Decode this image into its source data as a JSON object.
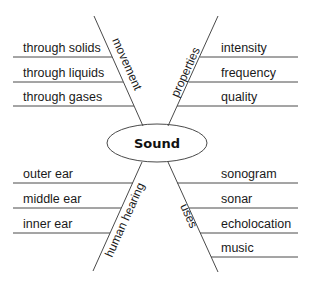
{
  "diagram": {
    "center": "Sound",
    "branches": {
      "movement": {
        "label": "movement",
        "items": [
          "through solids",
          "through liquids",
          "through gases"
        ]
      },
      "properties": {
        "label": "properties",
        "items": [
          "intensity",
          "frequency",
          "quality"
        ]
      },
      "human_hearing": {
        "label": "human hearing",
        "items": [
          "outer ear",
          "middle ear",
          "inner ear"
        ]
      },
      "uses": {
        "label": "uses",
        "items": [
          "sonogram",
          "sonar",
          "echolocation",
          "music"
        ]
      }
    }
  },
  "colors": {
    "line": "#4a4a4a",
    "text": "#1a1a1a",
    "background": "#ffffff"
  }
}
